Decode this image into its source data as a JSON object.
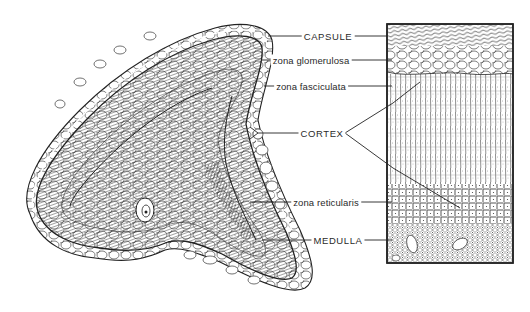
{
  "figure": {
    "labels": [
      {
        "id": "capsule",
        "text": "CAPSULE",
        "x": 328,
        "y": 36
      },
      {
        "id": "zona_glomerulosa",
        "text": "zona glomerulosa",
        "x": 311,
        "y": 60
      },
      {
        "id": "zona_fasciculata",
        "text": "zona fasciculata",
        "x": 311,
        "y": 86
      },
      {
        "id": "cortex",
        "text": "CORTEX",
        "x": 322,
        "y": 133
      },
      {
        "id": "zona_reticularis",
        "text": "zona reticularis",
        "x": 326,
        "y": 202
      },
      {
        "id": "medulla",
        "text": "MEDULLA",
        "x": 338,
        "y": 240
      }
    ],
    "colors": {
      "ink": "#1e1e1e",
      "background": "#ffffff",
      "text": "#2a2a2a"
    }
  }
}
